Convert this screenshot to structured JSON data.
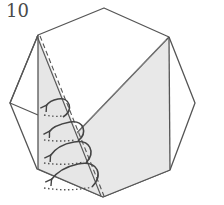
{
  "diagram": {
    "step_number": "10",
    "colors": {
      "stroke": "#555555",
      "shade": "#e6e6e6",
      "paper": "#ffffff",
      "arrow": "#444444"
    },
    "arrows": [
      {
        "label": "fold-arrow-1"
      },
      {
        "label": "fold-arrow-2"
      },
      {
        "label": "fold-arrow-3"
      },
      {
        "label": "fold-arrow-4"
      }
    ]
  }
}
